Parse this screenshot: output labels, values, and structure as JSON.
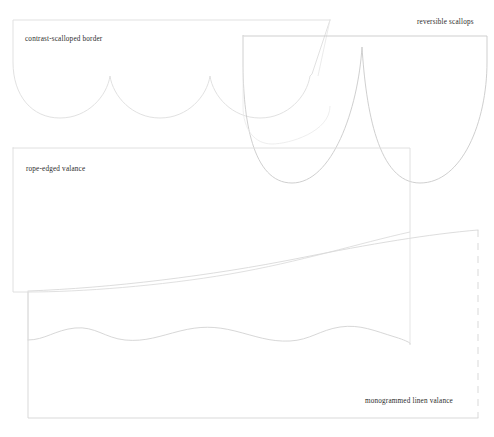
{
  "canvas": {
    "width": 494,
    "height": 437,
    "background_color": "#ffffff"
  },
  "stroke": {
    "default_color": "#d8d8d8",
    "emphasis_color": "#c9c9c9",
    "light_color": "#e2e2e2",
    "width": 0.8
  },
  "panels": [
    {
      "id": "contrast-scalloped-border",
      "label": "contrast-scalloped border",
      "label_position": "top-left",
      "edge_style": "scalloped",
      "scallop_count": 3,
      "stroke_color": "#dedede",
      "border_dashed": false,
      "bounds": {
        "x": 13,
        "y": 20,
        "width": 317,
        "height": 100
      }
    },
    {
      "id": "reversible-scallops",
      "label": "reversible scallops",
      "label_position": "top-right",
      "edge_style": "deep-scalloped",
      "scallop_count": 2,
      "stroke_color": "#c9c9c9",
      "border_dashed": false,
      "bounds": {
        "x": 243,
        "y": 36,
        "width": 244,
        "height": 147
      }
    },
    {
      "id": "rope-edged-valance",
      "label": "rope-edged valance",
      "label_position": "top-left",
      "edge_style": "swept-curve",
      "scallop_count": 1,
      "stroke_color": "#dcdcdc",
      "border_dashed": false,
      "bounds": {
        "x": 13,
        "y": 148,
        "width": 397,
        "height": 133
      }
    },
    {
      "id": "monogrammed-linen-valance",
      "label": "monogrammed linen valance",
      "label_position": "bottom-right",
      "edge_style": "wavy",
      "scallop_count": 4,
      "stroke_color": "#d5d5d5",
      "border_dashed": true,
      "bounds": {
        "x": 28,
        "y": 290,
        "width": 450,
        "height": 128
      }
    }
  ],
  "labels": {
    "contrast_scalloped_border": "contrast-scalloped border",
    "reversible_scallops": "reversible scallops",
    "rope_edged_valance": "rope-edged valance",
    "monogrammed_linen_valance": "monogrammed linen valance"
  }
}
